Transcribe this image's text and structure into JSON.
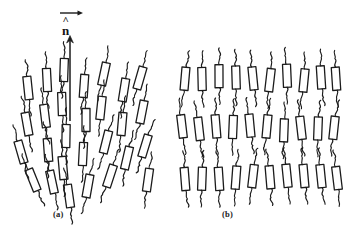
{
  "figure": {
    "background_color": "#ffffff",
    "ink_color": "#1b1b1b",
    "width": 348,
    "height": 233,
    "style": "hand-drawn line illustration"
  },
  "director": {
    "symbol": "n",
    "hat": "^",
    "arrow_icon": "up-arrow-icon",
    "top_arrow_icon": "right-arrow-icon",
    "shaft_x": 70,
    "shaft_top": 36,
    "shaft_bottom": 121
  },
  "panels": [
    {
      "id": "a",
      "label": "(a)",
      "phase": "nematic",
      "description": "rods share orientational order along the director but have no positional order",
      "label_x": 53,
      "label_y": 209
    },
    {
      "id": "b",
      "label": "(b)",
      "phase": "smectic",
      "description": "rods organised into distinct layers with both orientational and one-dimensional positional order",
      "label_x": 222,
      "label_y": 209,
      "layer_count": 3,
      "column_count": 10
    }
  ],
  "molecules": {
    "rod": {
      "shape": "open rectangle",
      "fill": "none",
      "stroke": "#1b1b1b",
      "length": 23,
      "width": 8
    },
    "tail": {
      "shape": "wavy chain",
      "stroke": "#1b1b1b"
    },
    "panel_a_rods": [
      {
        "x": 28,
        "y": 88,
        "angle": -6
      },
      {
        "x": 27,
        "y": 124,
        "angle": -10
      },
      {
        "x": 21,
        "y": 152,
        "angle": -16
      },
      {
        "x": 33,
        "y": 180,
        "angle": -22
      },
      {
        "x": 47,
        "y": 80,
        "angle": -3
      },
      {
        "x": 45,
        "y": 116,
        "angle": -7
      },
      {
        "x": 48,
        "y": 150,
        "angle": -4
      },
      {
        "x": 52,
        "y": 182,
        "angle": -12
      },
      {
        "x": 64,
        "y": 70,
        "angle": 2
      },
      {
        "x": 62,
        "y": 104,
        "angle": -2
      },
      {
        "x": 66,
        "y": 136,
        "angle": 1
      },
      {
        "x": 63,
        "y": 168,
        "angle": -5
      },
      {
        "x": 69,
        "y": 196,
        "angle": -8
      },
      {
        "x": 84,
        "y": 86,
        "angle": 4
      },
      {
        "x": 86,
        "y": 120,
        "angle": 0
      },
      {
        "x": 83,
        "y": 154,
        "angle": 3
      },
      {
        "x": 88,
        "y": 186,
        "angle": 10
      },
      {
        "x": 104,
        "y": 74,
        "angle": 12
      },
      {
        "x": 101,
        "y": 108,
        "angle": 6
      },
      {
        "x": 106,
        "y": 142,
        "angle": 14
      },
      {
        "x": 110,
        "y": 176,
        "angle": 18
      },
      {
        "x": 124,
        "y": 90,
        "angle": 9
      },
      {
        "x": 122,
        "y": 124,
        "angle": 5
      },
      {
        "x": 127,
        "y": 158,
        "angle": 13
      },
      {
        "x": 140,
        "y": 78,
        "angle": 16
      },
      {
        "x": 142,
        "y": 112,
        "angle": 11
      },
      {
        "x": 145,
        "y": 146,
        "angle": 17
      },
      {
        "x": 148,
        "y": 180,
        "angle": 8
      }
    ],
    "panel_b_layers": [
      {
        "y": 78,
        "rods": [
          185,
          202,
          219,
          236,
          253,
          270,
          287,
          304,
          321,
          336
        ]
      },
      {
        "y": 128,
        "rods": [
          182,
          199,
          216,
          233,
          250,
          267,
          284,
          301,
          318,
          334
        ]
      },
      {
        "y": 178,
        "rods": [
          185,
          202,
          219,
          236,
          253,
          270,
          287,
          304,
          321,
          337
        ]
      }
    ]
  }
}
